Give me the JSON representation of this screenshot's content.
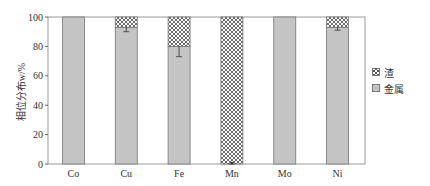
{
  "chart_data": {
    "type": "bar",
    "stacked": true,
    "title": "",
    "xlabel": "",
    "ylabel": "相位分布w/%",
    "ylim": [
      0,
      100
    ],
    "yticks": [
      0,
      20,
      40,
      60,
      80,
      100
    ],
    "categories": [
      "Co",
      "Cu",
      "Fe",
      "Mn",
      "Mo",
      "Ni"
    ],
    "series": [
      {
        "name": "金属",
        "values": [
          100,
          93,
          80,
          0,
          100,
          93
        ],
        "color": "#c4c4c4",
        "pattern": "solid"
      },
      {
        "name": "渣",
        "values": [
          0,
          7,
          20,
          100,
          0,
          7
        ],
        "color": "#ffffff",
        "pattern": "crosshatch"
      }
    ],
    "error_bars": {
      "Cu": 3,
      "Fe": 7,
      "Mn": 1,
      "Ni": 2
    },
    "legend": {
      "position": "right",
      "entries": [
        "渣",
        "金属"
      ]
    },
    "grid": false
  },
  "legend": {
    "slag_label": "渣",
    "metal_label": "金属"
  },
  "axis": {
    "ylabel": "相位分布w/%"
  }
}
